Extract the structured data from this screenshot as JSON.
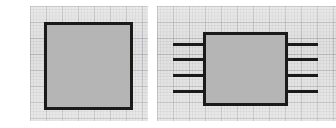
{
  "figure": {
    "title": "Two block-diagram sketches on graph paper",
    "background_color": "#ffffff",
    "paper_color": "#e0e0e0",
    "grid_line_color": "#78787f",
    "ink_color": "#1a1a1a",
    "block_fill_color": "#b5b5b5",
    "grid_major_spacing_px": 16,
    "grid_minor_spacing_px": 3.2
  },
  "panels": [
    {
      "id": "panel-left",
      "name": "plain-block-panel",
      "caption": "Plain rectangular block",
      "x": 30,
      "y": 6,
      "width": 118,
      "height": 115
    },
    {
      "id": "panel-right",
      "name": "pinned-block-panel",
      "caption": "Rectangular block with four leads per side",
      "x": 157,
      "y": 6,
      "width": 179,
      "height": 115
    }
  ],
  "shapes": {
    "left_block": {
      "name": "plain-rectangle",
      "label": "Block",
      "x": 44,
      "y": 22,
      "width": 88,
      "height": 88,
      "stroke_width": 3,
      "fill": "#b5b5b5",
      "stroke": "#1a1a1a"
    },
    "right_block": {
      "name": "pinned-rectangle",
      "label": "Block with pins",
      "x": 203,
      "y": 32,
      "width": 84,
      "height": 73,
      "stroke_width": 3,
      "fill": "#b5b5b5",
      "stroke": "#1a1a1a"
    }
  },
  "pins": {
    "stroke_width": 3,
    "stroke": "#1a1a1a",
    "left_side": [
      {
        "name": "pin-left-1",
        "label": "1",
        "x1": 173,
        "x2": 203,
        "y": 44
      },
      {
        "name": "pin-left-2",
        "label": "2",
        "x1": 173,
        "x2": 203,
        "y": 59
      },
      {
        "name": "pin-left-3",
        "label": "3",
        "x1": 173,
        "x2": 203,
        "y": 75
      },
      {
        "name": "pin-left-4",
        "label": "4",
        "x1": 173,
        "x2": 203,
        "y": 91
      }
    ],
    "right_side": [
      {
        "name": "pin-right-1",
        "label": "8",
        "x1": 287,
        "x2": 318,
        "y": 44
      },
      {
        "name": "pin-right-2",
        "label": "7",
        "x1": 287,
        "x2": 318,
        "y": 59
      },
      {
        "name": "pin-right-3",
        "label": "6",
        "x1": 287,
        "x2": 318,
        "y": 75
      },
      {
        "name": "pin-right-4",
        "label": "5",
        "x1": 287,
        "x2": 318,
        "y": 91
      }
    ]
  },
  "counts": {
    "panel_count": "2",
    "left_pin_count": "4",
    "right_pin_count": "4",
    "total_pin_count": "8"
  }
}
